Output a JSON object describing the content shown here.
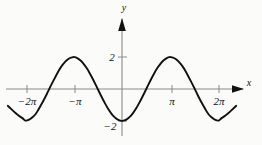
{
  "figure": {
    "name": "cosine-graph",
    "background_color": "#fbfbf9",
    "curve_color": "#111111",
    "axis_color": "#8a8a8a",
    "arrow_color": "#111111"
  },
  "axes": {
    "x_axis_label": "x",
    "y_axis_label": "y",
    "x_ticks": [
      {
        "label": "−2π",
        "value": -6.283185
      },
      {
        "label": "−π",
        "value": -3.141593
      },
      {
        "label": "π",
        "value": 3.141593
      },
      {
        "label": "2π",
        "value": 6.283185
      }
    ],
    "y_ticks": [
      {
        "label": "2",
        "value": 2
      },
      {
        "label": "−2",
        "value": -2
      }
    ]
  },
  "chart_data": {
    "type": "line",
    "title": "",
    "xlabel": "x",
    "ylabel": "y",
    "xlim": [
      -7.6,
      7.8
    ],
    "ylim": [
      -2.6,
      3.2
    ],
    "grid": false,
    "legend": null,
    "series": [
      {
        "name": "y = -2 cos(x)",
        "equation": "y = -2*cos(x)",
        "x": [
          -7.4,
          -7.2,
          -7.0,
          -6.8,
          -6.6,
          -6.4,
          -6.283185,
          -6.0,
          -5.8,
          -5.6,
          -5.4,
          -5.2,
          -5.0,
          -4.8,
          -4.712389,
          -4.6,
          -4.4,
          -4.2,
          -4.0,
          -3.8,
          -3.6,
          -3.4,
          -3.2,
          -3.141593,
          -3.0,
          -2.8,
          -2.6,
          -2.4,
          -2.2,
          -2.0,
          -1.8,
          -1.570796,
          -1.4,
          -1.2,
          -1.0,
          -0.8,
          -0.6,
          -0.4,
          -0.2,
          0.0,
          0.2,
          0.4,
          0.6,
          0.8,
          1.0,
          1.2,
          1.4,
          1.570796,
          1.8,
          2.0,
          2.2,
          2.4,
          2.6,
          2.8,
          3.0,
          3.141593,
          3.2,
          3.4,
          3.6,
          3.8,
          4.0,
          4.2,
          4.4,
          4.6,
          4.712389,
          4.8,
          5.0,
          5.2,
          5.4,
          5.6,
          5.8,
          6.0,
          6.283185,
          6.4,
          6.6,
          6.8,
          7.0,
          7.2,
          7.4
        ],
        "y": [
          -1.05,
          -1.23,
          -1.41,
          -1.58,
          -1.73,
          -1.85,
          -2.0,
          -1.92,
          -1.77,
          -1.59,
          -1.27,
          -0.92,
          -0.57,
          -0.18,
          0.0,
          0.23,
          0.6,
          0.97,
          1.31,
          1.58,
          1.79,
          1.93,
          1.99,
          2.0,
          1.98,
          1.88,
          1.71,
          1.47,
          1.18,
          0.83,
          0.45,
          0.0,
          -0.34,
          -0.72,
          -1.08,
          -1.39,
          -1.65,
          -1.84,
          -1.96,
          -2.0,
          -1.96,
          -1.84,
          -1.65,
          -1.39,
          -1.08,
          -0.72,
          -0.34,
          0.0,
          0.45,
          0.83,
          1.18,
          1.47,
          1.71,
          1.88,
          1.98,
          2.0,
          1.99,
          1.93,
          1.79,
          1.58,
          1.31,
          0.97,
          0.6,
          0.23,
          0.0,
          -0.18,
          -0.57,
          -0.92,
          -1.27,
          -1.59,
          -1.77,
          -1.92,
          -2.0,
          -1.85,
          -1.73,
          -1.58,
          -1.41,
          -1.23,
          -1.05
        ]
      }
    ]
  }
}
